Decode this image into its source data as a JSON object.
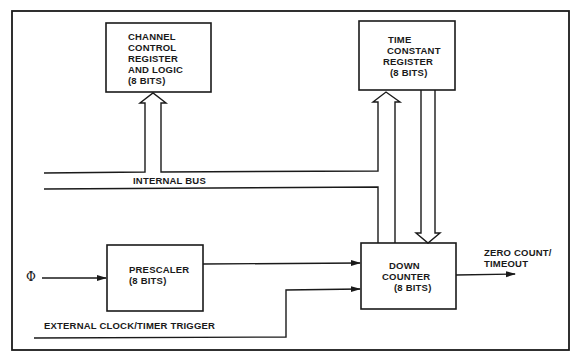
{
  "diagram": {
    "blocks": {
      "channel_control": [
        "CHANNEL",
        "CONTROL",
        "REGISTER",
        "AND LOGIC",
        "(8 BITS)"
      ],
      "time_constant": [
        "TIME",
        "CONSTANT",
        "REGISTER",
        "(8 BITS)"
      ],
      "prescaler": [
        "PRESCALER",
        "(8 BITS)"
      ],
      "down_counter": [
        "DOWN",
        "COUNTER",
        "(8 BITS)"
      ]
    },
    "labels": {
      "internal_bus": "INTERNAL BUS",
      "phi_input": "Φ",
      "external_trigger": "EXTERNAL CLOCK/TIMER TRIGGER",
      "output": [
        "ZERO COUNT/",
        "TIMEOUT"
      ]
    },
    "colors": {
      "line": "#1a1a1a",
      "background": "#ffffff"
    }
  }
}
